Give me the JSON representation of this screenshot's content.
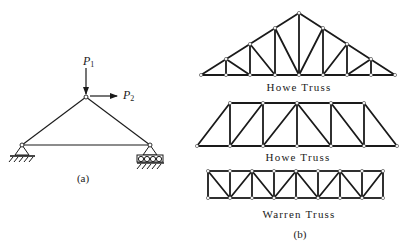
{
  "figure_a": {
    "caption": "(a)",
    "loads": [
      {
        "symbol": "P",
        "subscript": "1",
        "direction": "down"
      },
      {
        "symbol": "P",
        "subscript": "2",
        "direction": "right"
      }
    ],
    "supports": {
      "left": "pin",
      "right": "roller"
    }
  },
  "figure_b": {
    "caption": "(b)",
    "trusses": [
      {
        "name": "Howe Truss",
        "shape": "triangular-roof"
      },
      {
        "name": "Howe Truss",
        "shape": "trapezoidal"
      },
      {
        "name": "Warren Truss",
        "shape": "parallel-chord"
      }
    ]
  },
  "colors": {
    "line": "#1a1a1a",
    "background": "#ffffff"
  }
}
